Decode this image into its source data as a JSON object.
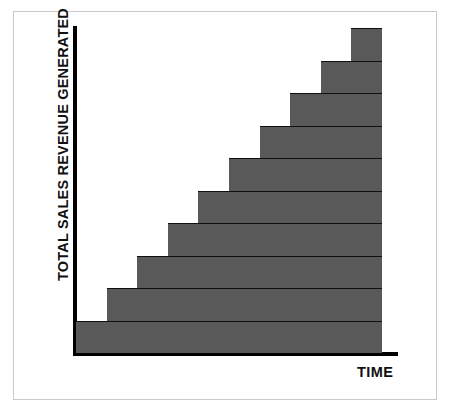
{
  "chart_data": {
    "type": "bar",
    "title": "",
    "subtitle": "",
    "xlabel": "TIME",
    "ylabel": "TOTAL SALES REVENUE GENERATED",
    "categories": [
      "1",
      "2",
      "3",
      "4",
      "5",
      "6",
      "7",
      "8",
      "9",
      "10"
    ],
    "values": [
      1,
      2,
      3,
      4,
      5,
      6,
      7,
      8,
      9,
      10
    ],
    "xlim": [
      0,
      10
    ],
    "ylim": [
      0,
      10
    ],
    "grid": false,
    "legend": false,
    "legend_position": "none",
    "tick_labels_x": [],
    "tick_labels_y": [],
    "annotations": [],
    "style": "cumulative ascending staircase; each step spans from its own left edge to the right edge of the plot, forming stacked horizontal bands",
    "series": [
      {
        "name": "Total sales revenue generated",
        "values": [
          1,
          2,
          3,
          4,
          5,
          6,
          7,
          8,
          9,
          10
        ]
      }
    ],
    "colors": {
      "fill": "#595959",
      "edge": "#101010",
      "axis": "#000000",
      "background": "#ffffff",
      "frame": "#c9c9c9"
    }
  },
  "axes": {
    "y_label": "TOTAL SALES REVENUE GENERATED",
    "x_label": "TIME"
  }
}
